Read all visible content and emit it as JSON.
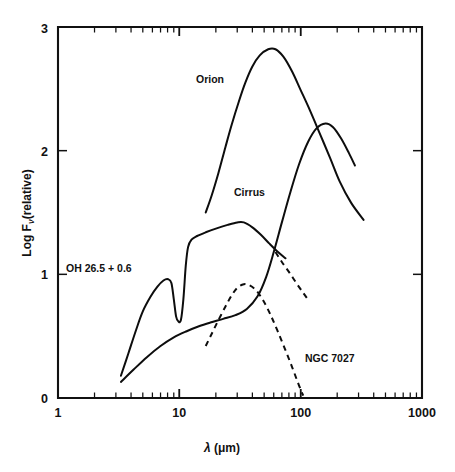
{
  "chart_data": {
    "type": "line",
    "title": "",
    "xlabel": "λ (μm)",
    "ylabel": "Log Fν(relative)",
    "xscale": "log",
    "yscale": "linear",
    "xlim": [
      1,
      1000
    ],
    "ylim": [
      0,
      3
    ],
    "grid": false,
    "legend_position": "inline-annotations",
    "xticks": [
      {
        "value": 1,
        "label": "1"
      },
      {
        "value": 10,
        "label": "10"
      },
      {
        "value": 100,
        "label": "100"
      },
      {
        "value": 1000,
        "label": "1000"
      }
    ],
    "yticks": [
      {
        "value": 0,
        "label": "0"
      },
      {
        "value": 1,
        "label": "1"
      },
      {
        "value": 2,
        "label": "2"
      },
      {
        "value": 3,
        "label": "3"
      }
    ],
    "series": [
      {
        "name": "OH 26.5 + 0.6",
        "style": "solid",
        "label_x": 5.0,
        "label_y": 1.03,
        "comment": "Oxygen-rich AGB star with deep 10 micron silicate absorption",
        "points": [
          [
            3.3,
            0.18
          ],
          [
            3.8,
            0.36
          ],
          [
            4.4,
            0.55
          ],
          [
            5.0,
            0.7
          ],
          [
            5.8,
            0.82
          ],
          [
            6.6,
            0.9
          ],
          [
            7.4,
            0.95
          ],
          [
            8.1,
            0.96
          ],
          [
            8.6,
            0.93
          ],
          [
            9.0,
            0.8
          ],
          [
            9.4,
            0.66
          ],
          [
            9.8,
            0.62
          ],
          [
            10.3,
            0.63
          ],
          [
            10.8,
            0.8
          ],
          [
            11.3,
            1.07
          ],
          [
            11.8,
            1.22
          ],
          [
            12.6,
            1.28
          ],
          [
            14.0,
            1.31
          ],
          [
            16.5,
            1.34
          ],
          [
            20.0,
            1.37
          ],
          [
            25.0,
            1.4
          ],
          [
            30.0,
            1.42
          ],
          [
            34.0,
            1.42
          ],
          [
            40.0,
            1.38
          ],
          [
            47.0,
            1.32
          ],
          [
            55.0,
            1.25
          ],
          [
            65.0,
            1.18
          ],
          [
            75.0,
            1.13
          ]
        ]
      },
      {
        "name": "Orion",
        "style": "solid",
        "label_x": 22.0,
        "label_y": 2.62,
        "comment": "Orion molecular cloud / HII region far-infrared peak near 60 micron",
        "points": [
          [
            16.5,
            1.5
          ],
          [
            18.5,
            1.64
          ],
          [
            21.0,
            1.82
          ],
          [
            24.0,
            2.03
          ],
          [
            27.0,
            2.21
          ],
          [
            31.0,
            2.4
          ],
          [
            35.0,
            2.55
          ],
          [
            40.0,
            2.68
          ],
          [
            46.0,
            2.77
          ],
          [
            54.0,
            2.82
          ],
          [
            62.0,
            2.82
          ],
          [
            72.0,
            2.76
          ],
          [
            85.0,
            2.64
          ],
          [
            100.0,
            2.49
          ],
          [
            120.0,
            2.32
          ],
          [
            145.0,
            2.13
          ],
          [
            175.0,
            1.94
          ],
          [
            210.0,
            1.75
          ],
          [
            260.0,
            1.58
          ],
          [
            330.0,
            1.44
          ]
        ]
      },
      {
        "name": "Cirrus",
        "style": "solid",
        "label_x": 40.0,
        "label_y": 1.67,
        "comment": "Galactic infrared cirrus; cold dust peaking near 150 micron",
        "points": [
          [
            3.3,
            0.13
          ],
          [
            4.2,
            0.23
          ],
          [
            5.4,
            0.33
          ],
          [
            7.0,
            0.42
          ],
          [
            9.0,
            0.49
          ],
          [
            11.5,
            0.54
          ],
          [
            14.5,
            0.58
          ],
          [
            18.0,
            0.61
          ],
          [
            23.0,
            0.64
          ],
          [
            29.0,
            0.67
          ],
          [
            36.0,
            0.72
          ],
          [
            44.0,
            0.82
          ],
          [
            52.0,
            0.98
          ],
          [
            60.0,
            1.18
          ],
          [
            70.0,
            1.42
          ],
          [
            82.0,
            1.66
          ],
          [
            97.0,
            1.89
          ],
          [
            115.0,
            2.07
          ],
          [
            135.0,
            2.18
          ],
          [
            160.0,
            2.22
          ],
          [
            185.0,
            2.19
          ],
          [
            215.0,
            2.1
          ],
          [
            250.0,
            1.98
          ],
          [
            280.0,
            1.88
          ]
        ]
      },
      {
        "name": "NGC 7027",
        "style": "dashed",
        "label_x": 125.0,
        "label_y": 0.27,
        "comment": "Planetary nebula; warm dust peak near 35 micron, steep long-wavelength falloff",
        "points": [
          [
            16.5,
            0.42
          ],
          [
            18.5,
            0.52
          ],
          [
            21.0,
            0.63
          ],
          [
            24.0,
            0.74
          ],
          [
            27.0,
            0.83
          ],
          [
            30.0,
            0.89
          ],
          [
            34.0,
            0.92
          ],
          [
            38.0,
            0.91
          ],
          [
            43.0,
            0.87
          ],
          [
            49.0,
            0.79
          ],
          [
            56.0,
            0.68
          ],
          [
            64.0,
            0.55
          ],
          [
            74.0,
            0.4
          ],
          [
            85.0,
            0.25
          ],
          [
            97.0,
            0.1
          ],
          [
            105.0,
            0.02
          ]
        ]
      },
      {
        "name": "NGC 7027 upper branch",
        "style": "dashed",
        "label_x": null,
        "label_y": null,
        "comment": "Short dashed segment descending from upper left toward 0.8 at 100 micron",
        "points": [
          [
            62.0,
            1.18
          ],
          [
            70.0,
            1.1
          ],
          [
            80.0,
            1.02
          ],
          [
            92.0,
            0.93
          ],
          [
            105.0,
            0.85
          ],
          [
            118.0,
            0.78
          ]
        ]
      }
    ],
    "annotations": [
      {
        "text": "Orion",
        "x": 22.0,
        "y": 2.62
      },
      {
        "text": "Cirrus",
        "x": 40.0,
        "y": 1.67
      },
      {
        "text": "OH 26.5 + 0.6",
        "x": 5.0,
        "y": 1.03
      },
      {
        "text": "NGC 7027",
        "x": 125.0,
        "y": 0.27
      }
    ]
  },
  "labels": {
    "orion": "Orion",
    "cirrus": "Cirrus",
    "oh": "OH 26.5 + 0.6",
    "ngc": "NGC 7027",
    "x_axis_lambda": "λ",
    "x_axis_units": "(μm)",
    "y_axis_log": "Log F",
    "y_axis_nu": "ν",
    "y_axis_rel": "(relative)",
    "xtick_1": "1",
    "xtick_10": "10",
    "xtick_100": "100",
    "xtick_1000": "1000",
    "ytick_0": "0",
    "ytick_1": "1",
    "ytick_2": "2",
    "ytick_3": "3"
  }
}
